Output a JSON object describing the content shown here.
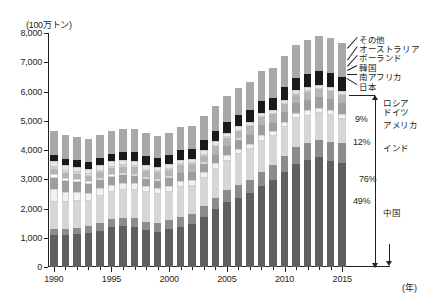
{
  "chart_data": {
    "type": "bar",
    "stacked": true,
    "title": "",
    "unit_label": "(100万トン)",
    "xlabel": "(年)",
    "ylabel": "",
    "ylim": [
      0,
      8000
    ],
    "ytick_labels": [
      "0",
      "1,000",
      "2,000",
      "3,000",
      "4,000",
      "5,000",
      "6,000",
      "7,000",
      "8,000"
    ],
    "ytick_values": [
      0,
      1000,
      2000,
      3000,
      4000,
      5000,
      6000,
      7000,
      8000
    ],
    "xtick_labels": [
      "1990",
      "1995",
      "2000",
      "2005",
      "2010",
      "2015"
    ],
    "xtick_values": [
      1990,
      1995,
      2000,
      2005,
      2010,
      2015
    ],
    "grid": false,
    "legend_position": "right",
    "categories": [
      1990,
      1991,
      1992,
      1993,
      1994,
      1995,
      1996,
      1997,
      1998,
      1999,
      2000,
      2001,
      2002,
      2003,
      2004,
      2005,
      2006,
      2007,
      2008,
      2009,
      2010,
      2011,
      2012,
      2013,
      2014,
      2015
    ],
    "series": [
      {
        "name": "中国",
        "color": "#5f5f5f",
        "values": [
          1080,
          1090,
          1120,
          1150,
          1240,
          1360,
          1400,
          1370,
          1250,
          1200,
          1290,
          1380,
          1460,
          1720,
          1990,
          2220,
          2370,
          2540,
          2780,
          2970,
          3240,
          3520,
          3650,
          3750,
          3640,
          3560
        ]
      },
      {
        "name": "インド",
        "color": "#8c8c8c",
        "values": [
          210,
          220,
          230,
          240,
          250,
          270,
          280,
          290,
          300,
          310,
          320,
          330,
          340,
          350,
          370,
          400,
          430,
          450,
          480,
          530,
          570,
          580,
          600,
          610,
          650,
          680
        ]
      },
      {
        "name": "アメリカ",
        "color": "#d6d6d6",
        "values": [
          930,
          900,
          900,
          860,
          940,
          940,
          970,
          990,
          1000,
          980,
          970,
          1020,
          980,
          970,
          990,
          1020,
          1050,
          1030,
          1060,
          970,
          980,
          990,
          920,
          900,
          910,
          810
        ]
      },
      {
        "name": "ドイツ",
        "color": "#f2f2f2",
        "values": [
          440,
          360,
          320,
          280,
          260,
          250,
          240,
          230,
          220,
          210,
          200,
          200,
          210,
          210,
          210,
          200,
          200,
          200,
          190,
          170,
          180,
          190,
          200,
          190,
          180,
          180
        ]
      },
      {
        "name": "ロシア",
        "color": "#9e9e9e",
        "values": [
          400,
          360,
          330,
          310,
          270,
          260,
          260,
          240,
          230,
          250,
          260,
          270,
          260,
          280,
          280,
          300,
          310,
          310,
          330,
          300,
          320,
          330,
          350,
          350,
          360,
          370
        ]
      },
      {
        "name": "日本",
        "color": "#ffffff",
        "values": [
          110,
          105,
          100,
          95,
          90,
          85,
          80,
          75,
          70,
          65,
          60,
          55,
          50,
          45,
          40,
          38,
          36,
          34,
          32,
          30,
          28,
          26,
          24,
          22,
          20,
          18
        ]
      },
      {
        "name": "南アフリカ",
        "color": "#b5b5b5",
        "values": [
          175,
          178,
          180,
          183,
          196,
          206,
          206,
          220,
          222,
          224,
          224,
          224,
          220,
          238,
          243,
          245,
          245,
          247,
          250,
          250,
          255,
          253,
          258,
          256,
          253,
          252
        ]
      },
      {
        "name": "韓国",
        "color": "#cfcfcf",
        "values": [
          60,
          58,
          55,
          52,
          48,
          45,
          42,
          38,
          35,
          32,
          30,
          28,
          26,
          24,
          22,
          20,
          19,
          18,
          17,
          16,
          15,
          14,
          13,
          12,
          11,
          10
        ]
      },
      {
        "name": "ポーランド",
        "color": "#e8e8e8",
        "values": [
          215,
          205,
          200,
          195,
          200,
          200,
          195,
          190,
          180,
          165,
          160,
          160,
          155,
          160,
          155,
          155,
          155,
          145,
          140,
          130,
          130,
          135,
          140,
          140,
          135,
          130
        ]
      },
      {
        "name": "オーストラリア",
        "color": "#1a1a1a",
        "values": [
          205,
          215,
          225,
          235,
          245,
          250,
          265,
          280,
          290,
          300,
          310,
          330,
          345,
          355,
          365,
          375,
          390,
          400,
          405,
          420,
          425,
          415,
          440,
          465,
          490,
          485
        ]
      },
      {
        "name": "その他",
        "color": "#a8a8a8",
        "values": [
          830,
          820,
          800,
          790,
          780,
          790,
          790,
          790,
          780,
          760,
          770,
          790,
          790,
          810,
          840,
          880,
          920,
          960,
          1010,
          1020,
          1080,
          1130,
          1180,
          1200,
          1200,
          1180
        ]
      }
    ],
    "annotations": {
      "pct_usa": "9%",
      "pct_india": "12%",
      "pct_total_top3": "76%",
      "pct_china": "49%"
    }
  },
  "legend": {
    "items": [
      {
        "label": "その他"
      },
      {
        "label": "オーストラリア"
      },
      {
        "label": "ポーランド"
      },
      {
        "label": "韓国"
      },
      {
        "label": "南アフリカ"
      },
      {
        "label": "日本"
      },
      {
        "label": "ロシア"
      },
      {
        "label": "ドイツ"
      },
      {
        "label": "アメリカ"
      },
      {
        "label": "インド"
      },
      {
        "label": "中国"
      }
    ]
  }
}
